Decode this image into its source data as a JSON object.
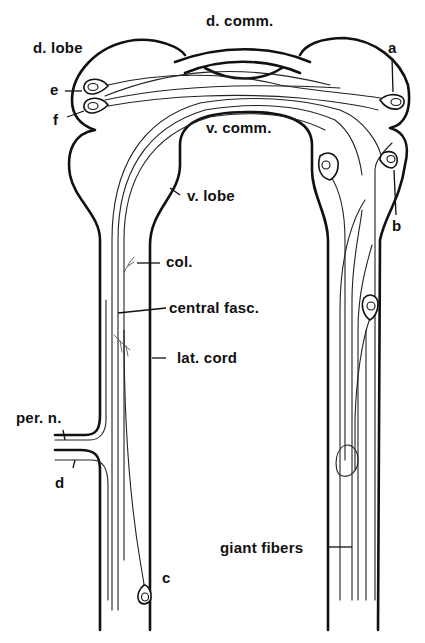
{
  "figure": {
    "labels": {
      "d_lobe": "d. lobe",
      "d_comm": "d. comm.",
      "v_comm": "v. comm.",
      "v_lobe": "v. lobe",
      "col": "col.",
      "central_fasc": "central fasc.",
      "lat_cord": "lat. cord",
      "per_n": "per. n.",
      "giant_fibers": "giant fibers",
      "a": "a",
      "b": "b",
      "c": "c",
      "d": "d",
      "e": "e",
      "f": "f"
    },
    "colors": {
      "background": "#ffffff",
      "ink": "#111111"
    }
  }
}
